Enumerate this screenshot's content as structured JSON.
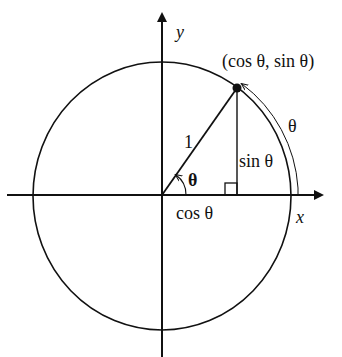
{
  "diagram": {
    "type": "unit-circle",
    "colors": {
      "stroke": "#111111",
      "background": "#ffffff"
    },
    "labels": {
      "y_axis": "y",
      "x_axis": "x",
      "point": "(cos θ, sin θ)",
      "radius": "1",
      "angle": "θ",
      "arc": "θ",
      "opposite_side": "sin θ",
      "adjacent_side": "cos θ"
    }
  }
}
